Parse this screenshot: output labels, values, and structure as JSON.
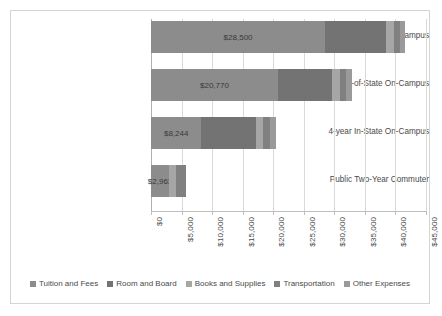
{
  "chart_data": {
    "type": "bar",
    "orientation": "horizontal",
    "stacked": true,
    "title": "",
    "xlabel": "",
    "ylabel": "",
    "xlim": [
      0,
      45000
    ],
    "xtick_step": 5000,
    "grid": true,
    "legend_position": "bottom",
    "tick_labels": [
      "$0",
      "$5,000",
      "$10,000",
      "$15,000",
      "$20,000",
      "$25,000",
      "$30,000",
      "$35,000",
      "$40,000",
      "$45,000"
    ],
    "categories": [
      "Private Non-profit On-Campus",
      "4-year Out-of-State On-Campus",
      "4-year In-State On-Campus",
      "Public Two-Year Commuter"
    ],
    "series": [
      {
        "name": "Tuition and Fees",
        "color": "#8c8c8c",
        "values": [
          28500,
          20770,
          8244,
          2963
        ]
      },
      {
        "name": "Room and Board",
        "color": "#737373",
        "values": [
          10000,
          8887,
          8887,
          0
        ]
      },
      {
        "name": "Books and Supplies",
        "color": "#a6a6a6",
        "values": [
          1200,
          1200,
          1200,
          1200
        ]
      },
      {
        "name": "Transportation",
        "color": "#808080",
        "values": [
          1000,
          1100,
          1100,
          1600
        ]
      },
      {
        "name": "Other Expenses",
        "color": "#9a9a9a",
        "values": [
          900,
          1000,
          1000,
          0
        ]
      }
    ],
    "bar_labels": [
      "$28,500",
      "$20,770",
      "$8,244",
      "$2,963"
    ]
  },
  "legend": {
    "items": [
      {
        "label": "Tuition and Fees",
        "color": "#8c8c8c"
      },
      {
        "label": "Room and Board",
        "color": "#737373"
      },
      {
        "label": "Books and Supplies",
        "color": "#a6a6a6"
      },
      {
        "label": "Transportation",
        "color": "#808080"
      },
      {
        "label": "Other Expenses",
        "color": "#9a9a9a"
      }
    ]
  }
}
